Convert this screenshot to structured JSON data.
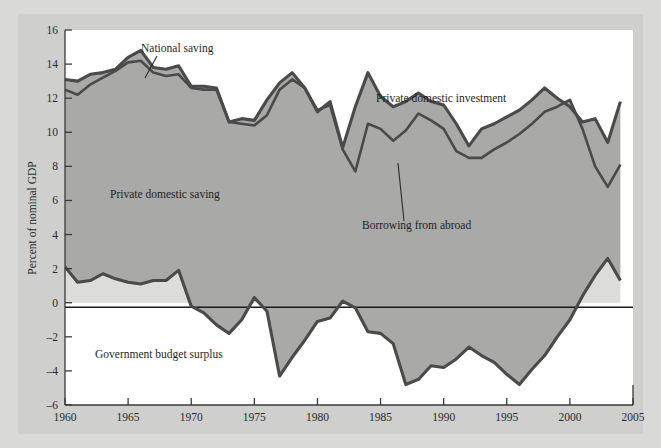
{
  "figure": {
    "background_color": "#d9d9d7",
    "plot_background": "#ffffff",
    "saving_fill": "#a9a9a7",
    "surplus_fill": "#d8d8d6",
    "line_color": "#4a4a4a"
  },
  "annotations": {
    "national_saving": "National saving",
    "private_domestic_investment": "Private domestic investment",
    "private_domestic_saving": "Private domestic saving",
    "borrowing_from_abroad": "Borrowing from abroad",
    "government_budget_surplus": "Government budget surplus"
  },
  "axes": {
    "ylabel": "Percent of nominal GDP",
    "y_ticks": [
      "16",
      "14",
      "12",
      "10",
      "8",
      "6",
      "4",
      "2",
      "0",
      "-2",
      "-4",
      "-6"
    ],
    "x_ticks": [
      "1960",
      "1965",
      "1970",
      "1975",
      "1980",
      "1985",
      "1990",
      "1995",
      "2000",
      "2005"
    ]
  },
  "chart_data": {
    "type": "area",
    "title": "",
    "xlabel": "",
    "ylabel": "Percent of nominal GDP",
    "xlim": [
      1960,
      2005
    ],
    "ylim": [
      -6,
      16
    ],
    "grid": false,
    "legend": "inline-annotations",
    "x": [
      1960,
      1961,
      1962,
      1963,
      1964,
      1965,
      1966,
      1967,
      1968,
      1969,
      1970,
      1971,
      1972,
      1973,
      1974,
      1975,
      1976,
      1977,
      1978,
      1979,
      1980,
      1981,
      1982,
      1983,
      1984,
      1985,
      1986,
      1987,
      1988,
      1989,
      1990,
      1991,
      1992,
      1993,
      1994,
      1995,
      1996,
      1997,
      1998,
      1999,
      2000,
      2001,
      2002,
      2003,
      2004
    ],
    "series": [
      {
        "name": "Private domestic investment",
        "description": "Upper boundary of shaded region; gross private domestic investment as percent of nominal GDP",
        "values": [
          13.1,
          13.0,
          13.4,
          13.5,
          13.7,
          14.4,
          14.8,
          13.8,
          13.7,
          13.9,
          12.7,
          12.7,
          12.6,
          10.6,
          10.8,
          10.7,
          11.9,
          12.9,
          13.5,
          12.6,
          11.2,
          11.8,
          9.1,
          11.5,
          13.5,
          12.1,
          11.5,
          11.8,
          12.3,
          11.8,
          11.6,
          10.5,
          9.2,
          10.2,
          10.5,
          10.9,
          11.3,
          11.9,
          12.6,
          12.0,
          11.5,
          10.6,
          10.8,
          9.4,
          11.8
        ]
      },
      {
        "name": "National saving",
        "description": "Lower/inner line; gross national saving as percent of nominal GDP. Gap to investment = borrowing from abroad",
        "values": [
          12.5,
          12.2,
          12.8,
          13.2,
          13.6,
          14.1,
          14.2,
          13.5,
          13.3,
          13.4,
          12.6,
          12.5,
          12.5,
          10.6,
          10.5,
          10.4,
          11.0,
          12.5,
          13.1,
          12.6,
          11.3,
          11.6,
          9.0,
          7.7,
          10.5,
          10.2,
          9.5,
          10.1,
          11.1,
          10.7,
          10.2,
          8.9,
          8.5,
          8.5,
          9.0,
          9.4,
          9.9,
          10.5,
          11.2,
          11.5,
          11.9,
          10.2,
          8.0,
          6.8,
          8.1
        ]
      },
      {
        "name": "Government budget surplus",
        "description": "Surplus (+) / deficit (-) of total government sector; lower boundary of shaded region",
        "values": [
          2.1,
          1.2,
          1.3,
          1.7,
          1.4,
          1.2,
          1.1,
          1.3,
          1.3,
          1.9,
          -0.2,
          -0.6,
          -1.3,
          -1.8,
          -1.0,
          0.3,
          -0.5,
          -4.3,
          -3.2,
          -2.2,
          -1.1,
          -0.9,
          0.1,
          -0.3,
          -1.7,
          -1.8,
          -2.4,
          -4.8,
          -4.5,
          -3.7,
          -3.8,
          -3.3,
          -2.6,
          -3.1,
          -3.5,
          -4.2,
          -4.8,
          -3.9,
          -3.1,
          -2.0,
          -1.0,
          0.4,
          1.6,
          2.6,
          1.3
        ]
      },
      {
        "name": "Private domestic saving",
        "description": "Shaded region between government budget surplus line and national saving line"
      }
    ],
    "notes": [
      "Shaded area between 'Government budget surplus' and 'National saving' is private domestic saving.",
      "Narrow band between 'National saving' and 'Private domestic investment' is borrowing from abroad.",
      "Light-shaded wedge above zero line around 1998-2001 is government budget surplus."
    ]
  }
}
